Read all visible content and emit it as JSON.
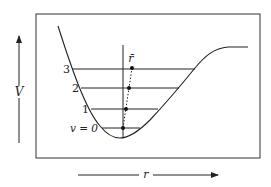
{
  "diagram": {
    "axes": {
      "y_label": "V",
      "x_label": "r"
    },
    "mean_label": "r̄",
    "levels": [
      {
        "label": "v = 0",
        "y": 128,
        "x1": 102,
        "x2": 140,
        "dot_x": 123
      },
      {
        "label": "1",
        "y": 109,
        "x1": 91,
        "x2": 158,
        "dot_x": 126
      },
      {
        "label": "2",
        "y": 88,
        "x1": 81,
        "x2": 179,
        "dot_x": 129
      },
      {
        "label": "3",
        "y": 69,
        "x1": 72,
        "x2": 195,
        "dot_x": 132
      }
    ],
    "colors": {
      "line": "#222222",
      "background": "#ffffff"
    }
  }
}
